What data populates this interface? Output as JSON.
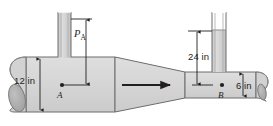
{
  "figure": {
    "colors": {
      "fill": "#d4d4d4",
      "fill_dark": "#b0b0b0",
      "stroke": "#6d6d6d",
      "ink": "#231f20",
      "background": "#ffffff"
    },
    "labels": {
      "diameter_left": "12 in",
      "diameter_right": "6 in",
      "head_right": "24 in",
      "pressure_a": "P",
      "pressure_a_sub": "A",
      "point_a": "A",
      "point_b": "B"
    },
    "annotations": {
      "flow_direction": "left-to-right",
      "left_section": "large-diameter-pipe",
      "right_section": "small-diameter-pipe",
      "middle_section": "tapered-contraction"
    }
  }
}
